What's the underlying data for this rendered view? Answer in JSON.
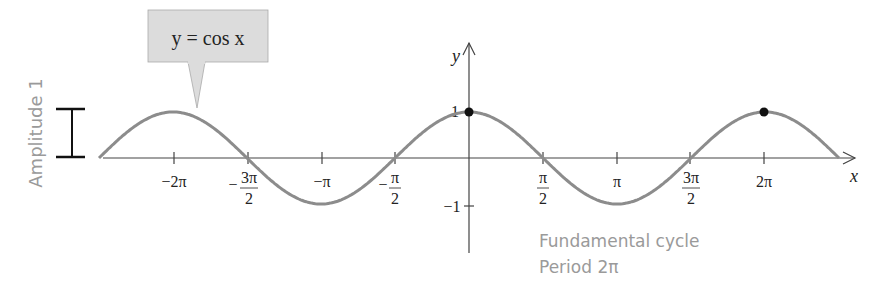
{
  "chart_data": {
    "type": "line",
    "title": "y = cos x",
    "function": "cos",
    "xlabel": "x",
    "ylabel": "y",
    "x_range": [
      -7.854,
      7.854
    ],
    "ylim": [
      -1,
      1
    ],
    "x_ticks": [
      "-2π",
      "-3π/2",
      "-π",
      "-π/2",
      "π/2",
      "π",
      "3π/2",
      "2π"
    ],
    "x_tick_values": [
      -6.2832,
      -4.7124,
      -3.1416,
      -1.5708,
      1.5708,
      3.1416,
      4.7124,
      6.2832
    ],
    "y_ticks": [
      "1",
      "-1"
    ],
    "y_tick_values": [
      1,
      -1
    ],
    "highlighted_points": [
      {
        "x": 0,
        "y": 1
      },
      {
        "x": 6.2832,
        "y": 1
      }
    ],
    "annotations": [
      "Amplitude 1",
      "Fundamental cycle",
      "Period 2π"
    ],
    "grid": false,
    "series": [
      {
        "name": "y = cos x",
        "x": [
          -7.854,
          -6.2832,
          -4.7124,
          -3.1416,
          -1.5708,
          0,
          1.5708,
          3.1416,
          4.7124,
          6.2832,
          7.854
        ],
        "values": [
          0,
          1,
          0,
          -1,
          0,
          1,
          0,
          -1,
          0,
          1,
          0
        ]
      }
    ]
  },
  "labels": {
    "callout": "y = cos x",
    "x_axis": "x",
    "y_axis": "y",
    "amplitude": "Amplitude 1",
    "cycle_line1": "Fundamental cycle",
    "cycle_line2": "Period 2π",
    "y_one": "1",
    "y_neg_one": "−1",
    "tick_neg2pi": "−2π",
    "tick_neg3pi2_num": "3π",
    "tick_neg3pi2_den": "2",
    "tick_negpi": "−π",
    "tick_negpi2_num": "π",
    "tick_negpi2_den": "2",
    "tick_pi2_num": "π",
    "tick_pi2_den": "2",
    "tick_pi": "π",
    "tick_3pi2_num": "3π",
    "tick_3pi2_den": "2",
    "tick_2pi": "2π"
  },
  "colors": {
    "curve": "#8c8c8c",
    "axis": "#444444",
    "callout_bg": "#dcdcdc",
    "annotation": "#9a9a9a"
  }
}
